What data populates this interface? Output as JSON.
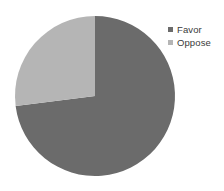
{
  "chart_data": {
    "type": "pie",
    "title": "",
    "subtitle": "",
    "xlabel": "",
    "ylabel": "",
    "categories": [
      "Favor",
      "Oppose"
    ],
    "values": [
      73,
      27
    ],
    "value_unit": "percent",
    "colors": [
      "#6b6b6b",
      "#b5b5b5"
    ],
    "start_angle_deg": 0,
    "direction": "clockwise",
    "legend_position": "top-right",
    "grid": false,
    "background": "#ffffff",
    "slices": [
      {
        "label": "Favor",
        "value": 73,
        "color": "#6b6b6b",
        "start_deg": 0,
        "end_deg": 262.6
      },
      {
        "label": "Oppose",
        "value": 27,
        "color": "#b5b5b5",
        "start_deg": 262.6,
        "end_deg": 360
      }
    ]
  },
  "legend": {
    "items": [
      {
        "label": "Favor",
        "color": "#6b6b6b",
        "swatch": "square-swatch"
      },
      {
        "label": "Oppose",
        "color": "#b5b5b5",
        "swatch": "square-swatch"
      }
    ]
  },
  "geometry": {
    "center_x": 95,
    "center_y": 96,
    "radius": 80
  }
}
